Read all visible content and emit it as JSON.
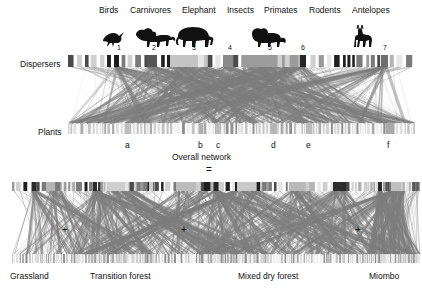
{
  "figure": {
    "overall_caption": "Overall network",
    "equals_sign": "=",
    "plus_sign": "+",
    "row_labels": {
      "top": "Dispersers",
      "bottom": "Plants"
    }
  },
  "disperser_groups": [
    {
      "label": "Birds",
      "icon": "bird-icon",
      "number": "1",
      "label_x": 99,
      "icon_x": 100,
      "num_x": 117,
      "node_x": 114,
      "node_w": 5,
      "shade": "#1a1a1a"
    },
    {
      "label": "Carnivores",
      "icon": "lion-icon",
      "number": "2",
      "label_x": 130,
      "icon_x": 136,
      "num_x": 152,
      "node_x": 147,
      "node_w": 10,
      "shade": "#555555"
    },
    {
      "label": "Elephant",
      "icon": "elephant-icon",
      "number": "3",
      "label_x": 178,
      "icon_x": 178,
      "num_x": 192,
      "node_x": 170,
      "node_w": 40,
      "shade": "#c4c4c4"
    },
    {
      "label": "Insects",
      "icon": "insect-icon",
      "number": "4",
      "label_x": 226,
      "icon_x": 0,
      "num_x": 228,
      "node_x": 223,
      "node_w": 11,
      "shade": "#8a8a8a"
    },
    {
      "label": "Primates",
      "icon": "baboon-icon",
      "number": "5",
      "label_x": 262,
      "icon_x": 255,
      "num_x": 268,
      "node_x": 243,
      "node_w": 56,
      "shade": "#9b9b9b"
    },
    {
      "label": "Rodents",
      "icon": "rodent-icon",
      "number": "6",
      "label_x": 305,
      "icon_x": 0,
      "num_x": 301,
      "node_x": 300,
      "node_w": 6,
      "shade": "#262626"
    },
    {
      "label": "Antelopes",
      "icon": "antelope-icon",
      "number": "7",
      "label_x": 350,
      "icon_x": 356,
      "num_x": 383,
      "node_x": 381,
      "node_w": 7,
      "shade": "#6e6e6e"
    }
  ],
  "plant_groups": [
    {
      "label": "a",
      "x": 125
    },
    {
      "label": "b",
      "x": 198
    },
    {
      "label": "c",
      "x": 216
    },
    {
      "label": "d",
      "x": 271
    },
    {
      "label": "e",
      "x": 306
    },
    {
      "label": "f",
      "x": 387
    }
  ],
  "subnetworks": [
    {
      "label": "Grassland",
      "x": 12,
      "w": 145,
      "label_x": 12
    },
    {
      "label": "Transition forest",
      "x": 72,
      "w": 200,
      "label_x": 72
    },
    {
      "label": "Mixed dry forest",
      "x": 196,
      "w": 225,
      "label_x": 196
    },
    {
      "label": "Miombo",
      "x": 368,
      "w": 102,
      "label_x": 368
    }
  ],
  "colors": {
    "link_light": "#d2d2d2",
    "link_mid": "#a8a8a8",
    "link_dark": "#8c8c8c",
    "node_default": "#b8b8b8",
    "text": "#111111"
  },
  "network_stats": {
    "disperser_node_count": 48,
    "plant_node_count": 96,
    "highlighted_disperser_groups": 7,
    "highlighted_plant_groups": 6,
    "subnetwork_count": 4
  }
}
